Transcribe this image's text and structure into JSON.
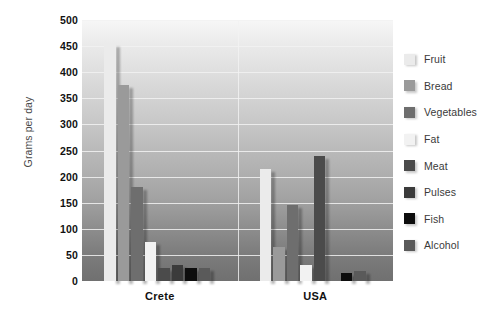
{
  "chart_data": {
    "type": "bar",
    "title": "",
    "subtitle": "",
    "xlabel": "",
    "ylabel": "Grams per day",
    "categories": [
      "Crete",
      "USA"
    ],
    "ylim": [
      0,
      500
    ],
    "ytick_step": 50,
    "yticks": [
      "500",
      "450",
      "400",
      "350",
      "300",
      "250",
      "200",
      "150",
      "100",
      "50",
      "0"
    ],
    "grid": true,
    "legend_position": "right",
    "series": [
      {
        "name": "Fruit",
        "color": "#ebebeb",
        "values": [
          455,
          215
        ]
      },
      {
        "name": "Bread",
        "color": "#9a9a9a",
        "values": [
          375,
          65
        ]
      },
      {
        "name": "Vegetables",
        "color": "#6e6e6e",
        "values": [
          180,
          145
        ]
      },
      {
        "name": "Fat",
        "color": "#f2f2f2",
        "values": [
          75,
          30
        ]
      },
      {
        "name": "Meat",
        "color": "#4b4b4b",
        "values": [
          25,
          240
        ]
      },
      {
        "name": "Pulses",
        "color": "#3b3b3b",
        "values": [
          30,
          0
        ]
      },
      {
        "name": "Fish",
        "color": "#0d0d0d",
        "values": [
          25,
          15
        ]
      },
      {
        "name": "Alcohol",
        "color": "#5a5a5a",
        "values": [
          25,
          20
        ]
      }
    ]
  },
  "legend": {
    "items": [
      {
        "label": "Fruit"
      },
      {
        "label": "Bread"
      },
      {
        "label": "Vegetables"
      },
      {
        "label": "Fat"
      },
      {
        "label": "Meat"
      },
      {
        "label": "Pulses"
      },
      {
        "label": "Fish"
      },
      {
        "label": "Alcohol"
      }
    ]
  },
  "colors": {
    "plot_bg_top": "#f7f7f7",
    "plot_bg_bottom": "#707070",
    "gridline": "#f2f2f2",
    "text": "#111111",
    "axis_title": "#4a4a4a"
  }
}
